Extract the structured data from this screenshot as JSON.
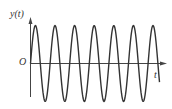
{
  "chart_data": {
    "type": "line",
    "title": "",
    "xlabel": "t",
    "ylabel": "y(t)",
    "origin_label": "O",
    "grid": false,
    "legend": null,
    "series": [
      {
        "name": "y(t)",
        "shape": "sine",
        "amplitude": 1,
        "cycles": 6.6,
        "phase_start": "zero, rising"
      }
    ],
    "x_ticks": [],
    "y_ticks": [],
    "colors": {
      "line": "#333333",
      "axis": "#444444"
    }
  },
  "labels": {
    "y_axis": "y(t)",
    "origin": "O",
    "x_axis": "t"
  }
}
